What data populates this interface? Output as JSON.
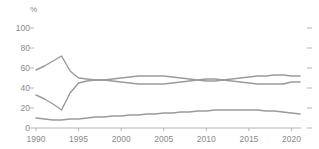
{
  "chart_data": {
    "type": "line",
    "title": "",
    "subtitle": "",
    "xlabel": "",
    "ylabel": "",
    "unit_label": "%",
    "xlim": [
      1990,
      2021
    ],
    "ylim": [
      0,
      100
    ],
    "grid": false,
    "legend_position": "none",
    "ytick_values": [
      100,
      80,
      60,
      40,
      20,
      0
    ],
    "ytick_labels": [
      "100",
      "80",
      "60",
      "40",
      "20",
      "0"
    ],
    "xtick_values": [
      1990,
      1995,
      2000,
      2005,
      2010,
      2015,
      2020
    ],
    "xtick_labels": [
      "1990",
      "1995",
      "2000",
      "2005",
      "2010",
      "2015",
      "2020"
    ],
    "right_axis_ticks": [
      100,
      80,
      60,
      40,
      20,
      0
    ],
    "line_color": "#9a9a9a",
    "axis_color": "#b5b5b5",
    "text_color": "#8a8a8a",
    "x": [
      1990,
      1991,
      1992,
      1993,
      1994,
      1995,
      1996,
      1997,
      1998,
      1999,
      2000,
      2001,
      2002,
      2003,
      2004,
      2005,
      2006,
      2007,
      2008,
      2009,
      2010,
      2011,
      2012,
      2013,
      2014,
      2015,
      2016,
      2017,
      2018,
      2019,
      2020,
      2021
    ],
    "series": [
      {
        "name": "series-1",
        "values": [
          58,
          62,
          67,
          72,
          57,
          50,
          49,
          48,
          48,
          49,
          50,
          51,
          52,
          52,
          52,
          52,
          51,
          50,
          49,
          48,
          47,
          47,
          48,
          49,
          50,
          51,
          52,
          52,
          53,
          53,
          52,
          52
        ]
      },
      {
        "name": "series-2",
        "values": [
          33,
          29,
          24,
          18,
          35,
          45,
          47,
          48,
          48,
          47,
          46,
          45,
          44,
          44,
          44,
          44,
          45,
          46,
          47,
          48,
          49,
          49,
          48,
          47,
          46,
          45,
          44,
          44,
          44,
          44,
          46,
          46
        ]
      },
      {
        "name": "series-3",
        "values": [
          10,
          9,
          8,
          8,
          9,
          9,
          10,
          11,
          11,
          12,
          12,
          13,
          13,
          14,
          14,
          15,
          15,
          16,
          16,
          17,
          17,
          18,
          18,
          18,
          18,
          18,
          18,
          17,
          17,
          16,
          15,
          14
        ]
      }
    ]
  }
}
